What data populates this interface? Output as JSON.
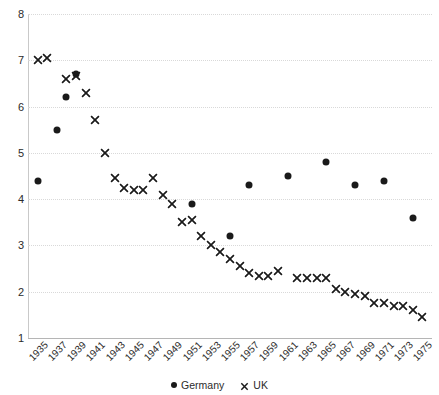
{
  "chart_data": {
    "type": "scatter",
    "title": "",
    "subtitle": "",
    "xlabel": "",
    "ylabel": "",
    "xlim": [
      1934,
      1976
    ],
    "ylim": [
      1,
      8
    ],
    "yticks": [
      1,
      2,
      3,
      4,
      5,
      6,
      7,
      8
    ],
    "grid": true,
    "legend_position": "bottom",
    "tick_labels": [
      "1935",
      "1937",
      "1939",
      "1941",
      "1943",
      "1945",
      "1947",
      "1949",
      "1951",
      "1953",
      "1955",
      "1957",
      "1959",
      "1961",
      "1963",
      "1965",
      "1967",
      "1969",
      "1971",
      "1973",
      "1975"
    ],
    "series": [
      {
        "name": "Germany",
        "marker": "circle",
        "color": "#1a1a1a",
        "points": [
          {
            "x": 1935,
            "y": 4.4
          },
          {
            "x": 1937,
            "y": 5.5
          },
          {
            "x": 1938,
            "y": 6.2
          },
          {
            "x": 1939,
            "y": 6.7
          },
          {
            "x": 1951,
            "y": 3.9
          },
          {
            "x": 1955,
            "y": 3.2
          },
          {
            "x": 1957,
            "y": 4.3
          },
          {
            "x": 1961,
            "y": 4.5
          },
          {
            "x": 1965,
            "y": 4.8
          },
          {
            "x": 1968,
            "y": 4.3
          },
          {
            "x": 1971,
            "y": 4.4
          },
          {
            "x": 1974,
            "y": 3.6
          }
        ]
      },
      {
        "name": "UK",
        "marker": "cross",
        "color": "#1a1a1a",
        "points": [
          {
            "x": 1935,
            "y": 7.0
          },
          {
            "x": 1936,
            "y": 7.05
          },
          {
            "x": 1938,
            "y": 6.6
          },
          {
            "x": 1939,
            "y": 6.65
          },
          {
            "x": 1940,
            "y": 6.3
          },
          {
            "x": 1941,
            "y": 5.7
          },
          {
            "x": 1942,
            "y": 5.0
          },
          {
            "x": 1943,
            "y": 4.45
          },
          {
            "x": 1944,
            "y": 4.25
          },
          {
            "x": 1945,
            "y": 4.2
          },
          {
            "x": 1946,
            "y": 4.2
          },
          {
            "x": 1947,
            "y": 4.45
          },
          {
            "x": 1948,
            "y": 4.1
          },
          {
            "x": 1949,
            "y": 3.9
          },
          {
            "x": 1950,
            "y": 3.5
          },
          {
            "x": 1951,
            "y": 3.55
          },
          {
            "x": 1952,
            "y": 3.2
          },
          {
            "x": 1953,
            "y": 3.0
          },
          {
            "x": 1954,
            "y": 2.85
          },
          {
            "x": 1955,
            "y": 2.7
          },
          {
            "x": 1956,
            "y": 2.55
          },
          {
            "x": 1957,
            "y": 2.4
          },
          {
            "x": 1958,
            "y": 2.35
          },
          {
            "x": 1959,
            "y": 2.35
          },
          {
            "x": 1960,
            "y": 2.45
          },
          {
            "x": 1962,
            "y": 2.3
          },
          {
            "x": 1963,
            "y": 2.3
          },
          {
            "x": 1964,
            "y": 2.3
          },
          {
            "x": 1965,
            "y": 2.3
          },
          {
            "x": 1966,
            "y": 2.05
          },
          {
            "x": 1967,
            "y": 2.0
          },
          {
            "x": 1968,
            "y": 1.95
          },
          {
            "x": 1969,
            "y": 1.9
          },
          {
            "x": 1970,
            "y": 1.75
          },
          {
            "x": 1971,
            "y": 1.75
          },
          {
            "x": 1972,
            "y": 1.7
          },
          {
            "x": 1973,
            "y": 1.7
          },
          {
            "x": 1974,
            "y": 1.6
          },
          {
            "x": 1975,
            "y": 1.45
          }
        ]
      }
    ]
  },
  "legend": [
    {
      "label": "Germany",
      "marker": "circle"
    },
    {
      "label": "UK",
      "marker": "cross"
    }
  ],
  "colors": {
    "marker": "#1a1a1a",
    "gridline": "#d9d9d9",
    "axis": "#b5b5b5",
    "background": "#ffffff"
  }
}
